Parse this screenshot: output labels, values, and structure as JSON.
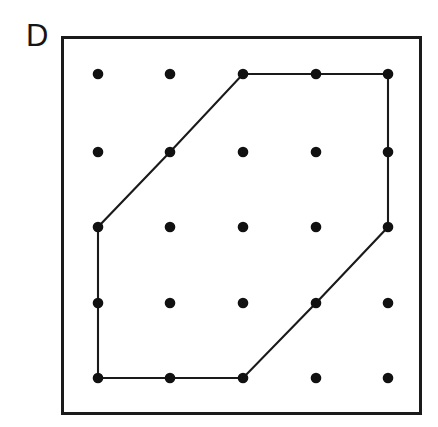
{
  "figure": {
    "panel_label": "D",
    "background_color": "#ffffff",
    "frame": {
      "name": "plot-frame",
      "x": 61,
      "y": 36,
      "width": 361,
      "height": 379,
      "stroke_color": "#1a1a1a",
      "stroke_width": 3
    }
  },
  "chart_data": {
    "type": "scatter",
    "title": "D",
    "xlabel": "",
    "ylabel": "",
    "grid": false,
    "legend": null,
    "lattice": {
      "rows": 5,
      "cols": 5,
      "dot_radius": 5.3,
      "dot_color": "#111111",
      "x_positions": [
        98,
        170,
        243,
        316,
        388
      ],
      "y_positions": [
        74,
        152,
        227,
        303,
        378
      ],
      "points": [
        {
          "col": 0,
          "row": 0,
          "x": 98,
          "y": 74
        },
        {
          "col": 1,
          "row": 0,
          "x": 170,
          "y": 74
        },
        {
          "col": 2,
          "row": 0,
          "x": 243,
          "y": 74
        },
        {
          "col": 3,
          "row": 0,
          "x": 316,
          "y": 74
        },
        {
          "col": 4,
          "row": 0,
          "x": 388,
          "y": 74
        },
        {
          "col": 0,
          "row": 1,
          "x": 98,
          "y": 152
        },
        {
          "col": 1,
          "row": 1,
          "x": 170,
          "y": 152
        },
        {
          "col": 2,
          "row": 1,
          "x": 243,
          "y": 152
        },
        {
          "col": 3,
          "row": 1,
          "x": 316,
          "y": 152
        },
        {
          "col": 4,
          "row": 1,
          "x": 388,
          "y": 152
        },
        {
          "col": 0,
          "row": 2,
          "x": 98,
          "y": 227
        },
        {
          "col": 1,
          "row": 2,
          "x": 170,
          "y": 227
        },
        {
          "col": 2,
          "row": 2,
          "x": 243,
          "y": 227
        },
        {
          "col": 3,
          "row": 2,
          "x": 316,
          "y": 227
        },
        {
          "col": 4,
          "row": 2,
          "x": 388,
          "y": 227
        },
        {
          "col": 0,
          "row": 3,
          "x": 98,
          "y": 303
        },
        {
          "col": 1,
          "row": 3,
          "x": 170,
          "y": 303
        },
        {
          "col": 2,
          "row": 3,
          "x": 243,
          "y": 303
        },
        {
          "col": 3,
          "row": 3,
          "x": 316,
          "y": 303
        },
        {
          "col": 4,
          "row": 3,
          "x": 388,
          "y": 303
        },
        {
          "col": 0,
          "row": 4,
          "x": 98,
          "y": 378
        },
        {
          "col": 1,
          "row": 4,
          "x": 170,
          "y": 378
        },
        {
          "col": 2,
          "row": 4,
          "x": 243,
          "y": 378
        },
        {
          "col": 3,
          "row": 4,
          "x": 316,
          "y": 378
        },
        {
          "col": 4,
          "row": 4,
          "x": 388,
          "y": 378
        }
      ]
    },
    "polygon": {
      "closed": true,
      "stroke_color": "#1a1a1a",
      "stroke_width": 2.1,
      "fill": "none",
      "vertex_count": 7,
      "vertices": [
        {
          "col": 2,
          "row": 0,
          "x": 243,
          "y": 74
        },
        {
          "col": 3,
          "row": 0,
          "x": 316,
          "y": 74
        },
        {
          "col": 4,
          "row": 0,
          "x": 388,
          "y": 74
        },
        {
          "col": 4,
          "row": 1,
          "x": 388,
          "y": 152
        },
        {
          "col": 4,
          "row": 2,
          "x": 388,
          "y": 227
        },
        {
          "col": 3,
          "row": 3,
          "x": 316,
          "y": 303
        },
        {
          "col": 2,
          "row": 4,
          "x": 243,
          "y": 378
        },
        {
          "col": 1,
          "row": 4,
          "x": 170,
          "y": 378
        },
        {
          "col": 0,
          "row": 4,
          "x": 98,
          "y": 378
        },
        {
          "col": 0,
          "row": 3,
          "x": 98,
          "y": 303
        },
        {
          "col": 0,
          "row": 2,
          "x": 98,
          "y": 227
        },
        {
          "col": 1,
          "row": 1,
          "x": 170,
          "y": 152
        }
      ],
      "path_points": "243,74 316,74 388,74 388,152 388,227 316,303 243,378 170,378 98,378 98,303 98,227 170,152"
    }
  }
}
